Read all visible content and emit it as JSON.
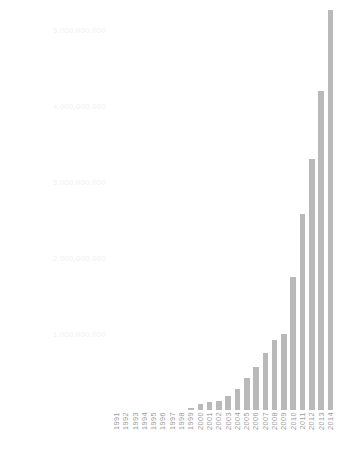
{
  "chart_data": {
    "type": "bar",
    "title": "",
    "subtitle": "",
    "xlabel": "",
    "ylabel": "",
    "grid": false,
    "legend": "none",
    "bar_color": "#b9b9b9",
    "axis_label_color": "#9b9b9b",
    "ytick_label_color": "#f0f0f0",
    "ylim": [
      0,
      5400000000
    ],
    "yticks": [
      1000000000,
      2000000000,
      3000000000,
      4000000000,
      5000000000
    ],
    "ytick_labels": [
      "1,000,000,000",
      "2,000,000,000",
      "3,000,000,000",
      "4,000,000,000",
      "5,000,000,000"
    ],
    "categories": [
      "1991",
      "1992",
      "1993",
      "1994",
      "1995",
      "1996",
      "1997",
      "1998",
      "1999",
      "2000",
      "2001",
      "2002",
      "2003",
      "2004",
      "2005",
      "2006",
      "2007",
      "2008",
      "2009",
      "2010",
      "2011",
      "2012",
      "2013",
      "2014"
    ],
    "values": [
      0,
      0,
      0,
      0,
      0,
      0,
      0,
      0,
      30000000,
      75000000,
      110000000,
      120000000,
      190000000,
      280000000,
      420000000,
      560000000,
      750000000,
      920000000,
      1000000000,
      1750000000,
      2580000000,
      3300000000,
      4200000000,
      5270000000
    ],
    "series": [
      {
        "name": "Value",
        "values": [
          0,
          0,
          0,
          0,
          0,
          0,
          0,
          0,
          30000000,
          75000000,
          110000000,
          120000000,
          190000000,
          280000000,
          420000000,
          560000000,
          750000000,
          920000000,
          1000000000,
          1750000000,
          2580000000,
          3300000000,
          4200000000,
          5270000000
        ]
      }
    ]
  }
}
